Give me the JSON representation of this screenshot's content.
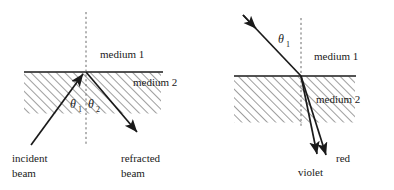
{
  "figure": {
    "title_semantic": "refraction-and-dispersion-diagram",
    "stroke_color": "#1a1a1a",
    "hatch_color": "#4d4d4d",
    "background": "#ffffff",
    "panels": [
      {
        "id": "left-panel",
        "name": "refraction-single-ray",
        "labels": {
          "medium1": "medium 1",
          "medium2": "medium 2",
          "theta1_symbol": "θ",
          "theta1_sub": "1",
          "theta2_symbol": "θ",
          "theta2_sub": "2",
          "incident_line1": "incident",
          "incident_line2": "beam",
          "refracted_line1": "refracted",
          "refracted_line2": "beam"
        },
        "geometry": {
          "interface_y": 72,
          "interface_x1": 24,
          "interface_x2": 163,
          "normal_x": 86,
          "normal_y1": 12,
          "normal_y2": 146,
          "hatch_box": {
            "x": 24,
            "y": 72,
            "w": 137,
            "h": 41
          },
          "incident_ray": {
            "x1": 31,
            "y1": 144,
            "x2": 86,
            "y2": 72
          },
          "refracted_ray": {
            "x1": 86,
            "y1": 72,
            "x2": 139,
            "y2": 135
          }
        }
      },
      {
        "id": "right-panel",
        "name": "dispersion-two-rays",
        "labels": {
          "medium1": "medium 1",
          "medium2": "medium 2",
          "theta1_symbol": "θ",
          "theta1_sub": "1",
          "violet": "violet",
          "red": "red"
        },
        "geometry": {
          "interface_y": 76,
          "interface_x1": 234,
          "interface_x2": 356,
          "normal_x": 301,
          "normal_y1": 18,
          "normal_y2": 128,
          "hatch_box": {
            "x": 234,
            "y": 76,
            "w": 121,
            "h": 46
          },
          "incident_ray": {
            "x1": 243,
            "y1": 15,
            "x2": 301,
            "y2": 76
          },
          "violet_ray": {
            "x1": 301,
            "y1": 76,
            "x2": 318,
            "y2": 158
          },
          "red_ray": {
            "x1": 301,
            "y1": 76,
            "x2": 328,
            "y2": 159
          }
        }
      }
    ]
  }
}
